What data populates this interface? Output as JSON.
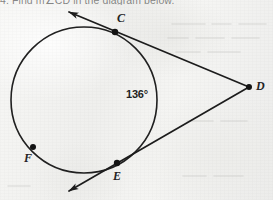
{
  "page": {
    "width": 273,
    "height": 200,
    "background_color": "#f3f3f1",
    "ink_color": "#1f1f1f"
  },
  "cropped_text": {
    "top_line": "4. Find m∠CD in the diagram below."
  },
  "figure": {
    "caption": "Circle with two tangent rays meeting at external point D",
    "circle": {
      "center_x": 84,
      "center_y": 100,
      "radius": 73,
      "stroke_color": "#202020"
    },
    "points": [
      {
        "id": "C",
        "label": "C",
        "x": 115,
        "y": 32,
        "label_x": 117,
        "label_y": 15,
        "dot": true
      },
      {
        "id": "D",
        "label": "D",
        "x": 249,
        "y": 87,
        "label_x": 256,
        "label_y": 81,
        "dot": true
      },
      {
        "id": "E",
        "label": "E",
        "x": 117,
        "y": 163,
        "label_x": 113,
        "label_y": 170,
        "dot": true
      },
      {
        "id": "F",
        "label": "F",
        "x": 33,
        "y": 147,
        "label_x": 25,
        "label_y": 153,
        "dot": true
      }
    ],
    "rays": [
      {
        "id": "ray-C-D",
        "from": "C",
        "to": "D",
        "arrow_x": 68,
        "arrow_y": 11,
        "arrowhead": "start"
      },
      {
        "id": "ray-E-D",
        "from": "E",
        "to": "D",
        "arrow_x": 68,
        "arrow_y": 192,
        "arrowhead": "start"
      }
    ],
    "angle_labels": [
      {
        "id": "arc-CE-measure",
        "text": "136°",
        "x": 127,
        "y": 89
      }
    ]
  }
}
